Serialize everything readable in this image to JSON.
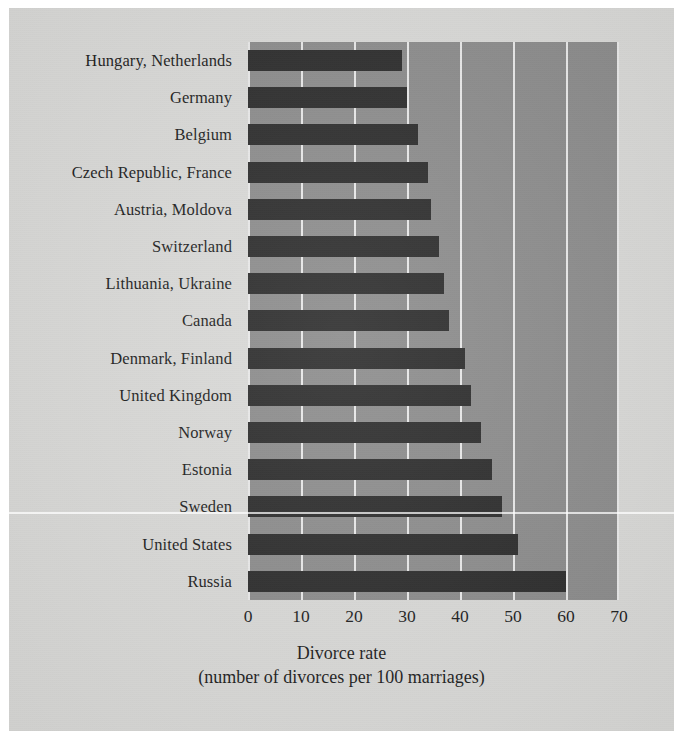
{
  "chart_data": {
    "type": "bar",
    "orientation": "horizontal",
    "title": "",
    "xlabel": "Divorce rate",
    "xlabel_sub": "(number of divorces per 100 marriages)",
    "ylabel": "",
    "xlim": [
      0,
      70
    ],
    "xticks": [
      0,
      10,
      20,
      30,
      40,
      50,
      60,
      70
    ],
    "xtick_labels": [
      "0",
      "10",
      "20",
      "30",
      "40",
      "50",
      "60",
      "70"
    ],
    "grid": true,
    "grid_axis": "x",
    "legend": false,
    "categories": [
      "Hungary, Netherlands",
      "Germany",
      "Belgium",
      "Czech Republic, France",
      "Austria, Moldova",
      "Switzerland",
      "Lithuania, Ukraine",
      "Canada",
      "Denmark, Finland",
      "United Kingdom",
      "Norway",
      "Estonia",
      "Sweden",
      "United States",
      "Russia"
    ],
    "values": [
      29,
      30,
      32,
      34,
      34.5,
      36,
      37,
      38,
      41,
      42,
      44,
      46,
      48,
      51,
      60
    ],
    "bar_color": "#2b2b2b",
    "plot_background": "#8b8b8b",
    "gridline_color": "#e9e9e9",
    "page_background": "#d9d9d7"
  },
  "axis": {
    "title_line1": "Divorce rate",
    "title_line2": "(number of divorces per 100 marriages)"
  }
}
